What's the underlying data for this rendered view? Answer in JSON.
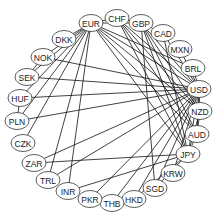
{
  "diagram": {
    "type": "circular-network-graph",
    "nodes": [
      {
        "id": "EUR",
        "label": "EUR",
        "x": 91,
        "y": 23
      },
      {
        "id": "CHF",
        "label": "CHF",
        "x": 117,
        "y": 18
      },
      {
        "id": "GBP",
        "label": "GBP",
        "x": 141,
        "y": 23
      },
      {
        "id": "CAD",
        "label": "CAD",
        "x": 163,
        "y": 33
      },
      {
        "id": "MXN",
        "label": "MXN",
        "x": 180,
        "y": 49
      },
      {
        "id": "BRL",
        "label": "BRL",
        "x": 193,
        "y": 68
      },
      {
        "id": "USD",
        "label": "USD",
        "x": 199,
        "y": 89
      },
      {
        "id": "NZD",
        "label": "NZD",
        "x": 200,
        "y": 111
      },
      {
        "id": "AUD",
        "label": "AUD",
        "x": 197,
        "y": 134
      },
      {
        "id": "JPY",
        "label": "JPY",
        "x": 188,
        "y": 154
      },
      {
        "id": "KRW",
        "label": "KRW",
        "x": 173,
        "y": 173
      },
      {
        "id": "SGD",
        "label": "SGD",
        "x": 155,
        "y": 188
      },
      {
        "id": "HKD",
        "label": "HKD",
        "x": 134,
        "y": 199
      },
      {
        "id": "THB",
        "label": "THB",
        "x": 112,
        "y": 203
      },
      {
        "id": "PKR",
        "label": "PKR",
        "x": 90,
        "y": 199
      },
      {
        "id": "INR",
        "label": "INR",
        "x": 68,
        "y": 191
      },
      {
        "id": "TRL",
        "label": "TRL",
        "x": 48,
        "y": 180
      },
      {
        "id": "ZAR",
        "label": "ZAR",
        "x": 34,
        "y": 163
      },
      {
        "id": "CZK",
        "label": "CZK",
        "x": 23,
        "y": 143
      },
      {
        "id": "PLN",
        "label": "PLN",
        "x": 17,
        "y": 121
      },
      {
        "id": "HUF",
        "label": "HUF",
        "x": 20,
        "y": 98
      },
      {
        "id": "SEK",
        "label": "SEK",
        "x": 27,
        "y": 77
      },
      {
        "id": "NOK",
        "label": "NOK",
        "x": 43,
        "y": 57
      },
      {
        "id": "DKK",
        "label": "DKK",
        "x": 64,
        "y": 39
      }
    ],
    "edges": [
      [
        "EUR",
        "DKK"
      ],
      [
        "EUR",
        "NOK"
      ],
      [
        "EUR",
        "SEK"
      ],
      [
        "EUR",
        "HUF"
      ],
      [
        "EUR",
        "PLN"
      ],
      [
        "EUR",
        "CZK"
      ],
      [
        "EUR",
        "TRL"
      ],
      [
        "EUR",
        "INR"
      ],
      [
        "EUR",
        "USD"
      ],
      [
        "EUR",
        "GBP"
      ],
      [
        "EUR",
        "CHF"
      ],
      [
        "EUR",
        "JPY"
      ],
      [
        "EUR",
        "BRL"
      ],
      [
        "EUR",
        "AUD"
      ],
      [
        "EUR",
        "NZD"
      ],
      [
        "CHF",
        "USD"
      ],
      [
        "CHF",
        "JPY"
      ],
      [
        "CHF",
        "GBP"
      ],
      [
        "CHF",
        "NZD"
      ],
      [
        "CHF",
        "AUD"
      ],
      [
        "GBP",
        "USD"
      ],
      [
        "GBP",
        "JPY"
      ],
      [
        "GBP",
        "AUD"
      ],
      [
        "GBP",
        "NZD"
      ],
      [
        "GBP",
        "CAD"
      ],
      [
        "GBP",
        "SGD"
      ],
      [
        "CAD",
        "USD"
      ],
      [
        "CAD",
        "JPY"
      ],
      [
        "MXN",
        "USD"
      ],
      [
        "BRL",
        "USD"
      ],
      [
        "USD",
        "NZD"
      ],
      [
        "USD",
        "AUD"
      ],
      [
        "USD",
        "JPY"
      ],
      [
        "USD",
        "KRW"
      ],
      [
        "USD",
        "SGD"
      ],
      [
        "USD",
        "HKD"
      ],
      [
        "USD",
        "THB"
      ],
      [
        "USD",
        "PKR"
      ],
      [
        "USD",
        "ZAR"
      ],
      [
        "USD",
        "TRL"
      ],
      [
        "USD",
        "SEK"
      ],
      [
        "USD",
        "NOK"
      ],
      [
        "USD",
        "HUF"
      ],
      [
        "USD",
        "PLN"
      ],
      [
        "NZD",
        "JPY"
      ],
      [
        "AUD",
        "JPY"
      ],
      [
        "AUD",
        "NZD"
      ],
      [
        "JPY",
        "INR"
      ],
      [
        "JPY",
        "ZAR"
      ],
      [
        "JPY",
        "SGD"
      ],
      [
        "JPY",
        "HKD"
      ],
      [
        "SEK",
        "NOK"
      ],
      [
        "PLN",
        "HUF"
      ]
    ]
  }
}
